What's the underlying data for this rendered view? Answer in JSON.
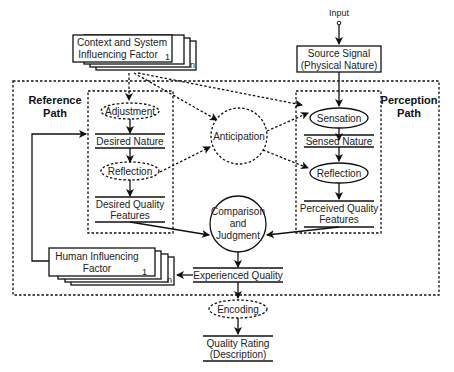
{
  "diagram": {
    "input_label": "Input",
    "source_signal": [
      "Source Signal",
      "(Physical Nature)"
    ],
    "context_factor": [
      "Context and System",
      "Influencing Factor"
    ],
    "context_factor_index_first": "1",
    "context_factor_index_last": "n",
    "reference_path_label": [
      "Reference",
      "Path"
    ],
    "perception_path_label": [
      "Perception",
      "Path"
    ],
    "reference_nodes": {
      "adjustment": "Adjustment",
      "desired_nature": "Desired Nature",
      "reflection": "Reflection",
      "desired_quality_features": [
        "Desired Quality",
        "Features"
      ]
    },
    "perception_nodes": {
      "sensation": "Sensation",
      "sensed_nature": "Sensed Nature",
      "reflection": "Reflection",
      "perceived_quality_features": [
        "Perceived Quality",
        "Features"
      ]
    },
    "anticipation": "Anticipation",
    "comparison": [
      "Comparison",
      "and",
      "Judgment"
    ],
    "human_factor": [
      "Human Influencing",
      "Factor"
    ],
    "human_factor_index_first": "1",
    "human_factor_index_last": "n",
    "experienced_quality": "Experienced Quality",
    "encoding": "Encoding",
    "quality_rating": [
      "Quality Rating",
      "(Description)"
    ]
  }
}
